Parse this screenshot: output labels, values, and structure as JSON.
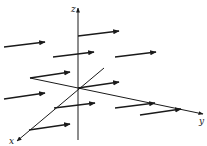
{
  "diagram": {
    "type": "3d-vector-field",
    "colors": {
      "ink": "#1a1a1a",
      "background": "#ffffff"
    },
    "axes": [
      {
        "name": "z",
        "label": "z",
        "from": [
          78,
          140
        ],
        "to": [
          78,
          8
        ],
        "label_pos": [
          71,
          12
        ]
      },
      {
        "name": "x",
        "label": "x",
        "from": [
          104,
          68
        ],
        "to": [
          17,
          141
        ],
        "label_pos": [
          9,
          144
        ]
      },
      {
        "name": "y",
        "label": "y",
        "from": [
          30,
          78
        ],
        "to": [
          203,
          114
        ],
        "label_pos": [
          199,
          124
        ]
      }
    ],
    "vectors": [
      {
        "from": [
          78,
          36
        ],
        "to": [
          119,
          31
        ]
      },
      {
        "from": [
          4,
          47
        ],
        "to": [
          45,
          42
        ]
      },
      {
        "from": [
          53,
          57
        ],
        "to": [
          94,
          52
        ]
      },
      {
        "from": [
          115,
          57
        ],
        "to": [
          156,
          52
        ]
      },
      {
        "from": [
          30,
          78
        ],
        "to": [
          70,
          72
        ]
      },
      {
        "from": [
          78,
          88
        ],
        "to": [
          119,
          82
        ]
      },
      {
        "from": [
          4,
          99
        ],
        "to": [
          45,
          93
        ]
      },
      {
        "from": [
          54,
          108
        ],
        "to": [
          95,
          103
        ]
      },
      {
        "from": [
          115,
          108
        ],
        "to": [
          155,
          103
        ]
      },
      {
        "from": [
          140,
          115
        ],
        "to": [
          181,
          109
        ]
      },
      {
        "from": [
          29,
          130
        ],
        "to": [
          70,
          124
        ]
      }
    ]
  }
}
